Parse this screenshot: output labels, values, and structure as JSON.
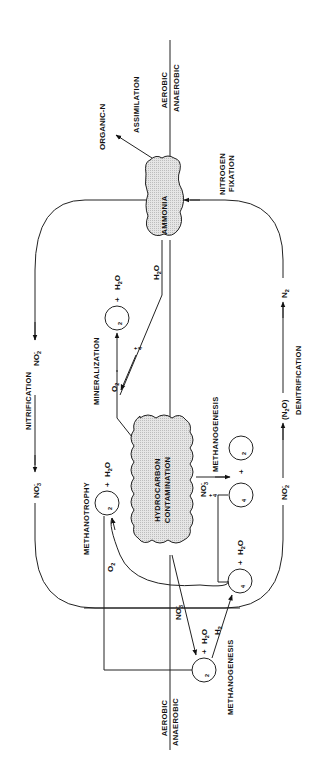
{
  "diagram": {
    "orientation": "rotated 90 degrees counter-clockwise (text reads bottom-to-top)",
    "zones": {
      "upper": "AEROBIC",
      "lower": "ANAEROBIC"
    },
    "nodes": {
      "ammonia": "AMMONIA",
      "hydrocarbon_1": "HYDROCARBON",
      "hydrocarbon_2": "CONTAMINATION"
    },
    "processes": {
      "assimilation": "ASSIMILATION",
      "nitrogen_fixation_1": "NITROGEN",
      "nitrogen_fixation_2": "FIXATION",
      "nitrification": "NITRIFICATION",
      "denitrification": "DENITRIFICATION",
      "mineralization": "MINERALIZATION",
      "methanotrophy": "METHANOTROPHY",
      "methanogenesis_upper": "METHANOGENESIS",
      "methanogenesis_lower": "METHANOGENESIS"
    },
    "species": {
      "organic_n": "ORGANIC-N",
      "no2": "NO",
      "no3": "NO",
      "n2": "N",
      "n2o_open": "(N",
      "n2o_close": "O)",
      "co2": "CO",
      "ch4": "CH",
      "h2o_h": "H",
      "h2o_o": "O",
      "nh4": "NH",
      "o2": "O",
      "h2": "H",
      "plus": "+",
      "sub2": "2",
      "sub3": "3",
      "sub4": "4",
      "minus": "-",
      "plusSup": "+"
    }
  }
}
